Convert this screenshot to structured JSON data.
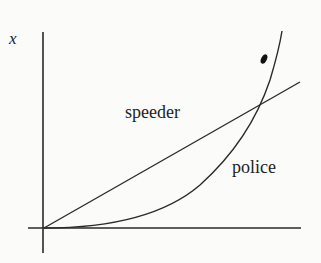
{
  "diagram": {
    "axis_label_y": "x",
    "curves": [
      {
        "name": "speeder",
        "label": "speeder",
        "shape": "straight line from origin"
      },
      {
        "name": "police",
        "label": "police",
        "shape": "curve starting flat at origin, accelerating upward, crossing speeder line"
      }
    ],
    "marker": "dot above intersection",
    "colors": {
      "ink": "#2a2a2a",
      "background": "#fbfbfa"
    }
  }
}
